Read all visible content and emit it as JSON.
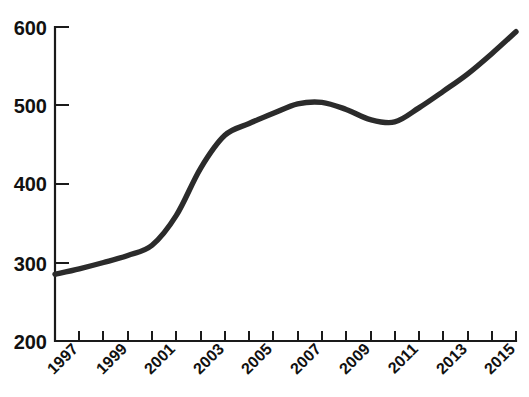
{
  "page": {
    "background_color": "#ffffff",
    "clipped_header_text": ""
  },
  "chart_data": {
    "type": "line",
    "title": "",
    "subtitle": "",
    "xlabel": "",
    "ylabel": "",
    "x": [
      1996,
      1997,
      1998,
      1999,
      2000,
      2001,
      2002,
      2003,
      2004,
      2005,
      2006,
      2007,
      2008,
      2009,
      2010,
      2011,
      2012,
      2013,
      2014,
      2015
    ],
    "values": [
      285,
      292,
      300,
      309,
      322,
      360,
      420,
      462,
      477,
      490,
      502,
      504,
      495,
      482,
      479,
      497,
      518,
      540,
      566,
      594
    ],
    "series": [
      {
        "name": "series-1",
        "color": "#2b2b2b",
        "values": [
          285,
          292,
          300,
          309,
          322,
          360,
          420,
          462,
          477,
          490,
          502,
          504,
          495,
          482,
          479,
          497,
          518,
          540,
          566,
          594
        ]
      }
    ],
    "xlim": [
      1996,
      2015
    ],
    "ylim": [
      200,
      600
    ],
    "yticks": [
      200,
      300,
      400,
      500,
      600
    ],
    "ytick_labels": [
      "200",
      "300",
      "400",
      "500",
      "600"
    ],
    "xticks": [
      1996,
      1997,
      1998,
      1999,
      2000,
      2001,
      2002,
      2003,
      2004,
      2005,
      2006,
      2007,
      2008,
      2009,
      2010,
      2011,
      2012,
      2013,
      2014,
      2015
    ],
    "xtick_labels_shown": [
      "1997",
      "1999",
      "2001",
      "2003",
      "2005",
      "2007",
      "2009",
      "2011",
      "2013",
      "2015"
    ],
    "xtick_label_rotation": -45,
    "grid": false,
    "legend": null,
    "legend_position": "none",
    "line_width": 5.4,
    "annotations": []
  },
  "axes": {
    "y_axis_name": "y-axis",
    "x_axis_name": "x-axis",
    "tick_color": "#1a1a1a",
    "axis_color": "#1a1a1a"
  }
}
